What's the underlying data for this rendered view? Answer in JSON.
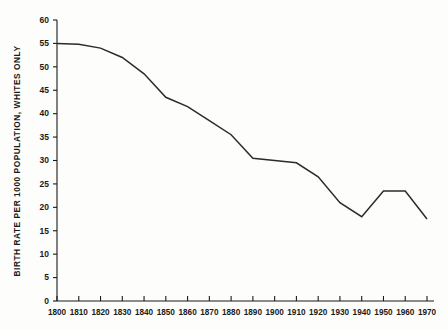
{
  "chart_data": {
    "type": "line",
    "title": "",
    "subtitle": "",
    "xlabel": "",
    "ylabel": "BIRTH RATE PER 1000 POPULATION, WHITES ONLY",
    "xlim": [
      1800,
      1970
    ],
    "ylim": [
      0,
      60
    ],
    "grid": false,
    "legend": null,
    "x": [
      1800,
      1810,
      1820,
      1830,
      1840,
      1850,
      1860,
      1870,
      1880,
      1890,
      1900,
      1910,
      1920,
      1930,
      1940,
      1950,
      1960,
      1970
    ],
    "values": [
      55,
      54.8,
      54,
      52,
      48.5,
      43.5,
      41.5,
      38.5,
      35.5,
      30.5,
      30,
      29.5,
      26.5,
      21,
      18,
      23.5,
      23.5,
      17.5
    ],
    "series": [
      {
        "name": "Birth rate per 1000 population, whites only",
        "values": [
          55,
          54.8,
          54,
          52,
          48.5,
          43.5,
          41.5,
          38.5,
          35.5,
          30.5,
          30,
          29.5,
          26.5,
          21,
          18,
          23.5,
          23.5,
          17.5
        ],
        "color": "#2b2b2b"
      }
    ],
    "x_tick_labels": [
      "1800",
      "1810",
      "1820",
      "1830",
      "1840",
      "1850",
      "1860",
      "1870",
      "1880",
      "1890",
      "1900",
      "1910",
      "1920",
      "1930",
      "1940",
      "1950",
      "1960",
      "1970"
    ],
    "y_tick_labels": [
      "0",
      "5",
      "10",
      "15",
      "20",
      "25",
      "30",
      "35",
      "40",
      "45",
      "50",
      "55",
      "60"
    ],
    "y_tick_values": [
      0,
      5,
      10,
      15,
      20,
      25,
      30,
      35,
      40,
      45,
      50,
      55,
      60
    ],
    "line_color": "#2b2b2b",
    "axis_color": "#1a1a1a",
    "background_color": "#fdfdfb"
  }
}
